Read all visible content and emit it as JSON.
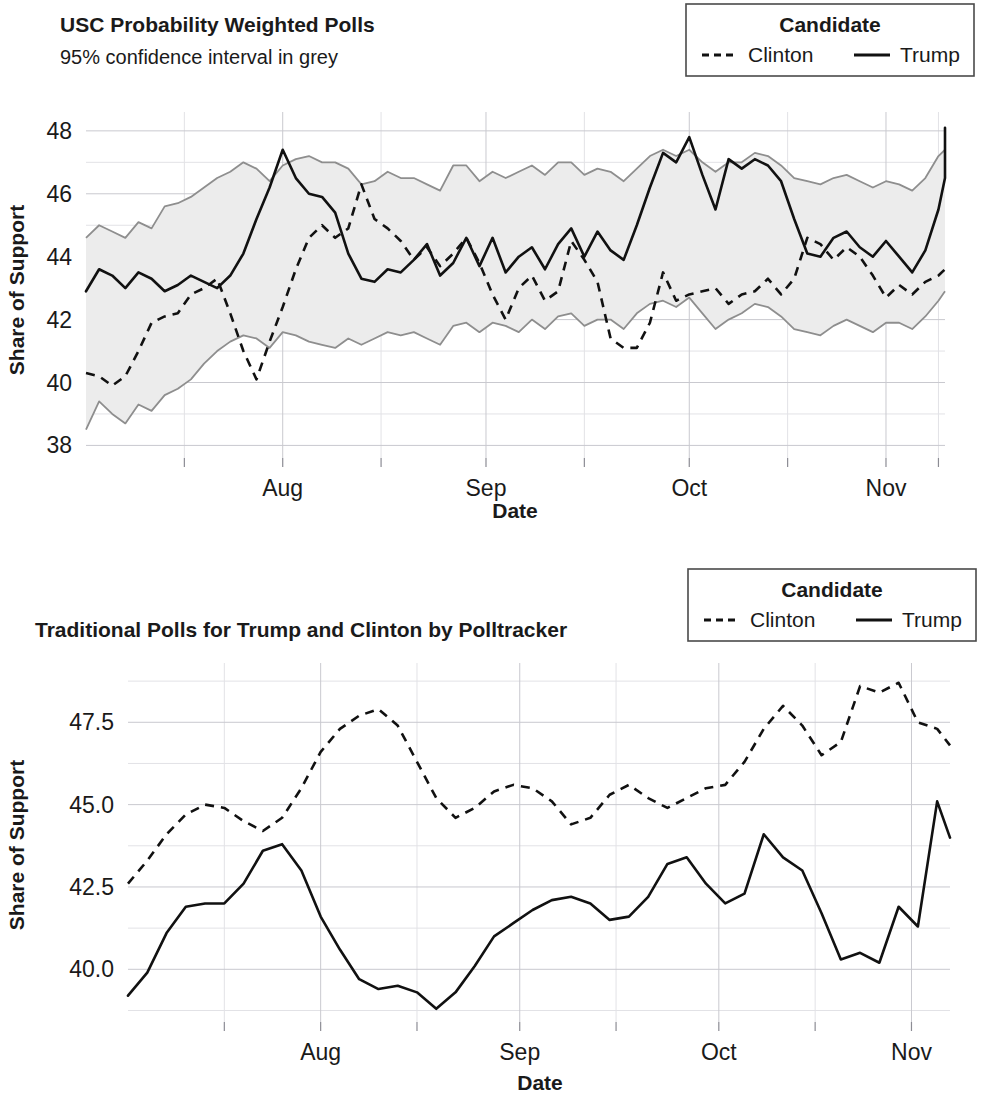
{
  "figure": {
    "width": 985,
    "height": 1107,
    "background": "#ffffff",
    "ink_color": "#111111",
    "band_fill_color": "#ececec",
    "band_edge_color": "#8e8e8e",
    "grid_major_color": "#c9c9cf",
    "grid_minor_color": "#e2e2e6"
  },
  "chart_data": [
    {
      "id": "usc-probability-weighted-polls",
      "type": "line",
      "title": "USC Probability Weighted Polls",
      "subtitle": "95% confidence interval in grey",
      "xlabel": "Date",
      "ylabel": "Share of Support",
      "ylim": [
        37.6,
        48.6
      ],
      "yticks": [
        38,
        40,
        42,
        44,
        46,
        48
      ],
      "ytick_labels": [
        "38",
        "40",
        "42",
        "44",
        "46",
        "48"
      ],
      "yticks_minor": [
        39,
        41,
        43,
        45,
        47
      ],
      "grid": true,
      "legend": {
        "title": "Candidate",
        "position": "top-right",
        "entries": [
          {
            "label": "Clinton",
            "style": "dashed"
          },
          {
            "label": "Trump",
            "style": "solid"
          }
        ]
      },
      "xticks": [
        30,
        61,
        92,
        122
      ],
      "xtick_labels": [
        "Aug",
        "Sep",
        "Oct",
        "Nov"
      ],
      "xticks_minor": [
        15,
        45,
        76,
        107,
        130
      ],
      "xlim": [
        0,
        131
      ],
      "annotations": [
        "95% confidence interval in grey"
      ],
      "series": [
        {
          "name": "Trump",
          "style": "solid",
          "x": [
            0,
            2,
            4,
            6,
            8,
            10,
            12,
            14,
            16,
            18,
            20,
            22,
            24,
            26,
            28,
            30,
            32,
            34,
            36,
            38,
            40,
            42,
            44,
            46,
            48,
            50,
            52,
            54,
            56,
            58,
            60,
            62,
            64,
            66,
            68,
            70,
            72,
            74,
            76,
            78,
            80,
            82,
            84,
            86,
            88,
            90,
            92,
            94,
            96,
            98,
            100,
            102,
            104,
            106,
            108,
            110,
            112,
            114,
            116,
            118,
            120,
            122,
            124,
            126,
            128,
            130,
            131
          ],
          "values": [
            42.9,
            43.6,
            43.4,
            43.0,
            43.5,
            43.3,
            42.9,
            43.1,
            43.4,
            43.2,
            43.0,
            43.4,
            44.1,
            45.2,
            46.2,
            47.4,
            46.5,
            46.0,
            45.9,
            45.4,
            44.1,
            43.3,
            43.2,
            43.6,
            43.5,
            43.9,
            44.4,
            43.4,
            43.8,
            44.6,
            43.7,
            44.6,
            43.5,
            44.0,
            44.3,
            43.6,
            44.4,
            44.9,
            44.0,
            44.8,
            44.2,
            43.9,
            45.0,
            46.2,
            47.3,
            47.0,
            47.8,
            46.6,
            45.5,
            47.1,
            46.8,
            47.1,
            46.9,
            46.4,
            45.2,
            44.1,
            44.0,
            44.6,
            44.8,
            44.3,
            44.0,
            44.5,
            44.0,
            43.5,
            44.2,
            45.5,
            46.5
          ],
          "values_tail": [
            47.0,
            47.6,
            47.2,
            48.1,
            47.6,
            47.0
          ]
        },
        {
          "name": "Clinton",
          "style": "dashed",
          "x": [
            0,
            2,
            4,
            6,
            8,
            10,
            12,
            14,
            16,
            18,
            20,
            22,
            24,
            26,
            28,
            30,
            32,
            34,
            36,
            38,
            40,
            42,
            44,
            46,
            48,
            50,
            52,
            54,
            56,
            58,
            60,
            62,
            64,
            66,
            68,
            70,
            72,
            74,
            76,
            78,
            80,
            82,
            84,
            86,
            88,
            90,
            92,
            94,
            96,
            98,
            100,
            102,
            104,
            106,
            108,
            110,
            112,
            114,
            116,
            118,
            120,
            122,
            124,
            126,
            128,
            130,
            131
          ],
          "values": [
            40.3,
            40.2,
            39.9,
            40.2,
            41.0,
            41.9,
            42.1,
            42.2,
            42.8,
            43.0,
            43.3,
            42.2,
            41.0,
            40.1,
            41.3,
            42.4,
            43.6,
            44.6,
            45.0,
            44.6,
            44.9,
            46.3,
            45.2,
            44.9,
            44.5,
            43.9,
            44.3,
            43.7,
            44.1,
            44.6,
            43.8,
            42.8,
            42.0,
            43.0,
            43.4,
            42.6,
            42.9,
            44.5,
            43.9,
            43.2,
            41.4,
            41.1,
            41.1,
            41.9,
            43.5,
            42.6,
            42.8,
            42.9,
            43.0,
            42.5,
            42.8,
            42.9,
            43.3,
            42.8,
            43.3,
            44.6,
            44.4,
            43.9,
            44.3,
            44.0,
            43.4,
            42.7,
            43.1,
            42.8,
            43.2,
            43.4,
            43.6
          ]
        }
      ],
      "confidence_band": {
        "label": "95% confidence interval",
        "upper": [
          44.6,
          45.0,
          44.8,
          44.6,
          45.1,
          44.9,
          45.6,
          45.7,
          45.9,
          46.2,
          46.5,
          46.7,
          47.0,
          46.8,
          46.4,
          46.9,
          47.1,
          47.2,
          47.0,
          47.0,
          46.8,
          46.3,
          46.4,
          46.7,
          46.5,
          46.5,
          46.3,
          46.1,
          46.9,
          46.9,
          46.4,
          46.7,
          46.5,
          46.7,
          46.9,
          46.6,
          47.0,
          47.0,
          46.6,
          46.8,
          46.7,
          46.4,
          46.8,
          47.2,
          47.4,
          47.2,
          47.4,
          47.0,
          46.7,
          47.0,
          47.0,
          47.3,
          47.2,
          46.9,
          46.5,
          46.4,
          46.3,
          46.5,
          46.6,
          46.4,
          46.2,
          46.4,
          46.3,
          46.1,
          46.5,
          47.2,
          47.4
        ],
        "lower": [
          38.5,
          39.4,
          39.0,
          38.7,
          39.3,
          39.1,
          39.6,
          39.8,
          40.1,
          40.6,
          41.0,
          41.3,
          41.5,
          41.4,
          41.1,
          41.6,
          41.5,
          41.3,
          41.2,
          41.1,
          41.4,
          41.2,
          41.4,
          41.6,
          41.5,
          41.6,
          41.4,
          41.2,
          41.8,
          41.9,
          41.6,
          41.9,
          41.8,
          41.6,
          42.0,
          41.7,
          42.1,
          42.2,
          41.8,
          42.0,
          42.0,
          41.7,
          42.2,
          42.5,
          42.6,
          42.4,
          42.7,
          42.2,
          41.7,
          42.0,
          42.2,
          42.5,
          42.4,
          42.1,
          41.7,
          41.6,
          41.5,
          41.8,
          42.0,
          41.8,
          41.6,
          41.9,
          41.9,
          41.7,
          42.1,
          42.6,
          42.9
        ]
      }
    },
    {
      "id": "traditional-polls-polltracker",
      "type": "line",
      "title": "Traditional Polls for Trump and Clinton by Polltracker",
      "subtitle": "",
      "xlabel": "Date",
      "ylabel": "Share of Support",
      "ylim": [
        38.4,
        49.3
      ],
      "yticks": [
        40.0,
        42.5,
        45.0,
        47.5
      ],
      "ytick_labels": [
        "40.0",
        "42.5",
        "45.0",
        "47.5"
      ],
      "yticks_minor": [
        38.75,
        41.25,
        43.75,
        46.25,
        48.75
      ],
      "grid": true,
      "legend": {
        "title": "Candidate",
        "position": "top-right",
        "entries": [
          {
            "label": "Clinton",
            "style": "dashed"
          },
          {
            "label": "Trump",
            "style": "solid"
          }
        ]
      },
      "xticks": [
        30,
        61,
        92,
        122
      ],
      "xtick_labels": [
        "Aug",
        "Sep",
        "Oct",
        "Nov"
      ],
      "xticks_minor": [
        15,
        45,
        76,
        107
      ],
      "xlim": [
        0,
        128
      ],
      "series": [
        {
          "name": "Clinton",
          "style": "dashed",
          "x": [
            0,
            3,
            6,
            9,
            12,
            15,
            18,
            21,
            24,
            27,
            30,
            33,
            36,
            39,
            42,
            45,
            48,
            51,
            54,
            57,
            60,
            63,
            66,
            69,
            72,
            75,
            78,
            81,
            84,
            87,
            90,
            93,
            96,
            99,
            102,
            105,
            108,
            111,
            114,
            117,
            120,
            123,
            126,
            128
          ],
          "values": [
            42.6,
            43.3,
            44.1,
            44.7,
            45.0,
            44.9,
            44.5,
            44.2,
            44.6,
            45.5,
            46.6,
            47.3,
            47.7,
            47.9,
            47.4,
            46.3,
            45.2,
            44.6,
            44.9,
            45.4,
            45.6,
            45.5,
            45.1,
            44.4,
            44.6,
            45.3,
            45.6,
            45.2,
            44.9,
            45.2,
            45.5,
            45.6,
            46.3,
            47.3,
            48.0,
            47.4,
            46.5,
            46.9,
            48.6,
            48.4,
            48.7,
            47.5,
            47.3,
            46.8
          ]
        },
        {
          "name": "Trump",
          "style": "solid",
          "x": [
            0,
            3,
            6,
            9,
            12,
            15,
            18,
            21,
            24,
            27,
            30,
            33,
            36,
            39,
            42,
            45,
            48,
            51,
            54,
            57,
            60,
            63,
            66,
            69,
            72,
            75,
            78,
            81,
            84,
            87,
            90,
            93,
            96,
            99,
            102,
            105,
            108,
            111,
            114,
            117,
            120,
            123,
            126,
            128
          ],
          "values": [
            39.2,
            39.9,
            41.1,
            41.9,
            42.0,
            42.0,
            42.6,
            43.6,
            43.8,
            43.0,
            41.6,
            40.6,
            39.7,
            39.4,
            39.5,
            39.3,
            38.8,
            39.3,
            40.1,
            41.0,
            41.4,
            41.8,
            42.1,
            42.2,
            42.0,
            41.5,
            41.6,
            42.2,
            43.2,
            43.4,
            42.6,
            42.0,
            42.3,
            44.1,
            43.4,
            43.0,
            41.7,
            40.3,
            40.5,
            40.2,
            41.9,
            41.3,
            45.1,
            44.0
          ]
        }
      ]
    }
  ]
}
